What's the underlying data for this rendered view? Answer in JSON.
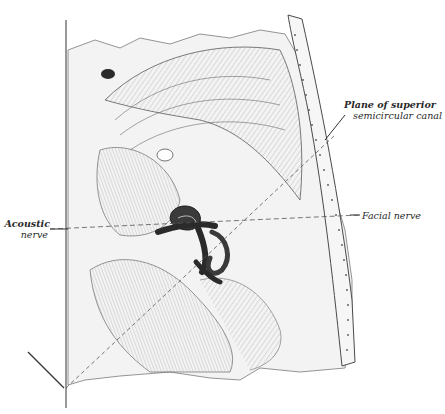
{
  "figure": {
    "style": "engraved line illustration, monochrome",
    "colors": {
      "background": "#ffffff",
      "ink": "#3a3a3a",
      "bone_fill": "#efefef",
      "labyrinth": "#2e2e2e"
    }
  },
  "labels": {
    "plane_of_superior_canal": {
      "line1": "Plane of superior",
      "line2": "semicircular canal"
    },
    "acoustic_nerve": {
      "line1": "Acoustic",
      "line2": "nerve"
    },
    "facial_nerve": {
      "text": "Facial nerve"
    }
  }
}
